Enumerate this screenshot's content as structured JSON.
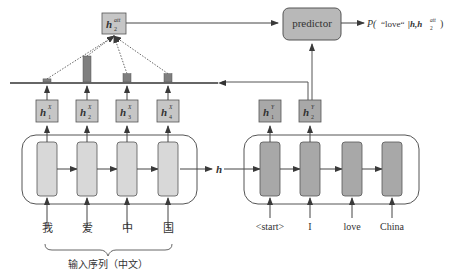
{
  "colors": {
    "line": "#4a4a4a",
    "cell_light": "#d8d8d8",
    "cell_dark": "#a8a8a8",
    "hidden_box": "#c6c6c6",
    "predictor_fill": "#b8b8b8",
    "attn_bar": "#7f7f7f",
    "text": "#333333"
  },
  "attention": {
    "context_label_main": "h",
    "context_label_sup": "att",
    "context_label_sub": "2",
    "weights": [
      0.12,
      1.0,
      0.32,
      0.32
    ]
  },
  "predictor": {
    "label": "predictor",
    "output_prefix": "P(",
    "output_word": "“love“",
    "output_cond": "|h,h",
    "output_sup": "att",
    "output_sub": "2",
    "output_suffix": ")"
  },
  "encoder": {
    "hidden_states": [
      {
        "main": "h",
        "sup": "X",
        "sub": "1"
      },
      {
        "main": "h",
        "sup": "X",
        "sub": "2"
      },
      {
        "main": "h",
        "sup": "X",
        "sub": "3"
      },
      {
        "main": "h",
        "sup": "X",
        "sub": "4"
      }
    ],
    "inputs": [
      "我",
      "爱",
      "中",
      "国"
    ],
    "brace_label": "输入序列（中文）",
    "output_label": "h"
  },
  "decoder": {
    "hidden_states": [
      {
        "main": "h",
        "sup": "Y",
        "sub": "1"
      },
      {
        "main": "h",
        "sup": "Y",
        "sub": "2"
      }
    ],
    "inputs": [
      "<start>",
      "I",
      "love",
      "China"
    ]
  }
}
